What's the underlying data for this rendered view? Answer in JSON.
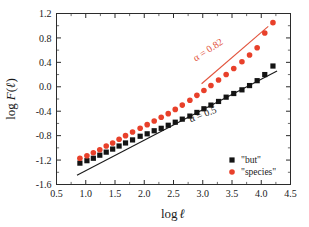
{
  "chart_data": {
    "type": "scatter",
    "title": "",
    "xlabel": "log ℓ",
    "ylabel": "log F(ℓ)",
    "xlim": [
      0.5,
      4.5
    ],
    "ylim": [
      -1.6,
      1.2
    ],
    "xticks": [
      "0.5",
      "1.0",
      "1.5",
      "2.0",
      "2.5",
      "3.0",
      "3.5",
      "4.0",
      "4.5"
    ],
    "yticks": [
      "1.2",
      "0.8",
      "0.4",
      "0.0",
      "-0.4",
      "-0.8",
      "-1.2",
      "-1.6"
    ],
    "xtick_values": [
      0.5,
      1.0,
      1.5,
      2.0,
      2.5,
      3.0,
      3.5,
      4.0,
      4.5
    ],
    "ytick_values": [
      1.2,
      0.8,
      0.4,
      0.0,
      -0.4,
      -0.8,
      -1.2,
      -1.6
    ],
    "minor_ticks_per_interval": 1,
    "grid": false,
    "legend_position": "bottom-right",
    "series": [
      {
        "name": "\"but\"",
        "marker": "square",
        "color": "#141414",
        "x": [
          0.9,
          1.02,
          1.13,
          1.24,
          1.35,
          1.46,
          1.57,
          1.68,
          1.8,
          1.93,
          2.05,
          2.17,
          2.29,
          2.41,
          2.53,
          2.65,
          2.78,
          2.9,
          3.02,
          3.14,
          3.27,
          3.4,
          3.53,
          3.67,
          3.8,
          3.93,
          4.06,
          4.2
        ],
        "y": [
          -1.25,
          -1.21,
          -1.17,
          -1.12,
          -1.07,
          -1.02,
          -0.97,
          -0.92,
          -0.87,
          -0.81,
          -0.77,
          -0.72,
          -0.68,
          -0.63,
          -0.58,
          -0.53,
          -0.48,
          -0.42,
          -0.36,
          -0.3,
          -0.24,
          -0.17,
          -0.11,
          -0.05,
          0.02,
          0.1,
          0.2,
          0.34
        ]
      },
      {
        "name": "\"species\"",
        "marker": "circle",
        "color": "#e8402a",
        "x": [
          0.9,
          1.02,
          1.13,
          1.24,
          1.35,
          1.46,
          1.57,
          1.68,
          1.8,
          1.93,
          2.05,
          2.17,
          2.29,
          2.41,
          2.53,
          2.65,
          2.78,
          2.9,
          3.02,
          3.14,
          3.27,
          3.4,
          3.53,
          3.67,
          3.8,
          3.93,
          4.06,
          4.2
        ],
        "y": [
          -1.17,
          -1.13,
          -1.08,
          -1.03,
          -0.97,
          -0.92,
          -0.86,
          -0.8,
          -0.74,
          -0.68,
          -0.62,
          -0.56,
          -0.5,
          -0.44,
          -0.37,
          -0.3,
          -0.22,
          -0.14,
          -0.06,
          0.02,
          0.11,
          0.2,
          0.3,
          0.41,
          0.52,
          0.64,
          0.88,
          1.05
        ]
      }
    ],
    "annotations": [
      {
        "text": "α = 0.82",
        "color": "#e2533c",
        "rotation": -33,
        "x": 3.12,
        "y": 0.56
      },
      {
        "text": "α = 0.5",
        "color": "#1a1a1a",
        "rotation": -21,
        "x": 3.02,
        "y": -0.5
      }
    ],
    "guide_lines": [
      {
        "name": "alpha-0.5-line",
        "color": "#1a1a1a",
        "slope": 0.5,
        "x0": 0.85,
        "y0": -1.45,
        "x1": 4.27,
        "y1": 0.26
      },
      {
        "name": "alpha-0.82-line",
        "color": "#e2533c",
        "slope": 0.82,
        "x0": 2.98,
        "y0": 0.05,
        "x1": 4.12,
        "y1": 0.99
      }
    ]
  },
  "legend": {
    "entries": [
      {
        "label": "\"but\"",
        "marker": "square",
        "color": "#141414"
      },
      {
        "label": "\"species\"",
        "marker": "circle",
        "color": "#e8402a"
      }
    ]
  },
  "axis_titles": {
    "x": {
      "prefix": "log",
      "symbol": "ℓ"
    },
    "y": {
      "prefix": "log",
      "func": "F",
      "open": "(",
      "symbol": "ℓ",
      "close": ")"
    }
  }
}
